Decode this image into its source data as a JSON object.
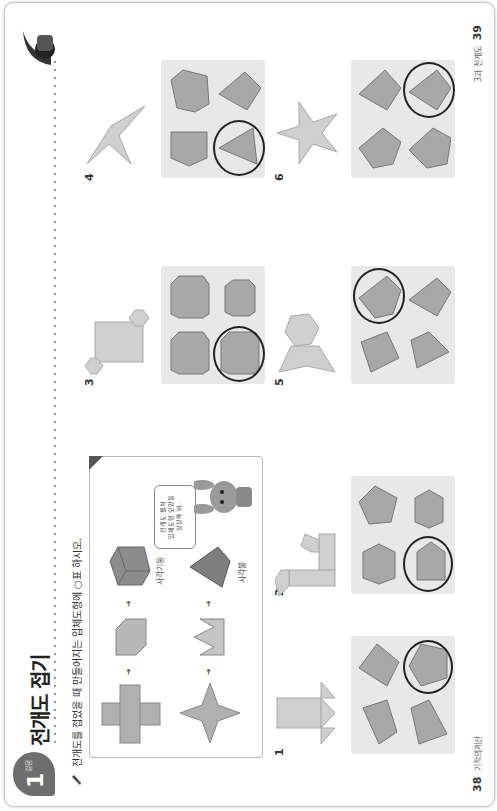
{
  "page": {
    "orientation": "rotated-90-ccw",
    "header": {
      "badge_number": "1",
      "badge_sub": "걸음",
      "title": "전개도 접기"
    },
    "instruction": "전개도를 접었을 때 만들어지는 입체도형에 ○표 하시오.",
    "example_box": {
      "rows": [
        {
          "net": "square-cross-net",
          "step": "partially-folded-box",
          "solid": "rectangular-prism",
          "label": "사각기둥"
        },
        {
          "net": "four-point-star-net",
          "step": "crown-folded-net",
          "solid": "square-pyramid",
          "label": "사각뿔"
        }
      ],
      "speech_bubble": [
        "전개도 펼쳐",
        "입체도형 모양을",
        "상상해 봐."
      ],
      "mascot": "bunny"
    },
    "problems": [
      {
        "number": "1",
        "net": "square-with-triangles",
        "options": [
          "pyramid-a",
          "prism-tri",
          "pyramid-b",
          "pyramid-c"
        ],
        "answer_index": 3
      },
      {
        "number": "2",
        "net": "pentagonal-prism-net",
        "options": [
          "hex-prism-a",
          "pent-prism-a",
          "pent-prism-b",
          "hex-prism-b"
        ],
        "answer_index": 2
      },
      {
        "number": "3",
        "net": "hexagonal-prism-net",
        "options": [
          "hex-prism-c",
          "hex-prism-d",
          "hex-prism-e",
          "hex-prism-f"
        ],
        "answer_index": 2
      },
      {
        "number": "4",
        "net": "three-point-star-net",
        "options": [
          "tri-prism",
          "quad-prism",
          "tri-pyramid-a",
          "tri-pyramid-b"
        ],
        "answer_index": 2
      },
      {
        "number": "5",
        "net": "hexagonal-pyramid-net",
        "options": [
          "pyr-a",
          "pyr-b",
          "pyr-c",
          "pyr-d"
        ],
        "answer_index": 1
      },
      {
        "number": "6",
        "net": "five-point-star-net",
        "options": [
          "pent-pyr-a",
          "pent-pyr-b",
          "pent-pyr-c",
          "pent-pyr-d"
        ],
        "answer_index": 3
      }
    ],
    "footer": {
      "left_page_number": "38",
      "left_page_label": "기적의계산",
      "right_page_label": "3과 전개도",
      "right_page_number": "39"
    },
    "colors": {
      "badge": "#6e6e6e",
      "option_bg": "#e8e8e8",
      "shape_fill": "#a8a8a8",
      "net_fill": "#cfcfcf",
      "ring": "#222222"
    }
  }
}
